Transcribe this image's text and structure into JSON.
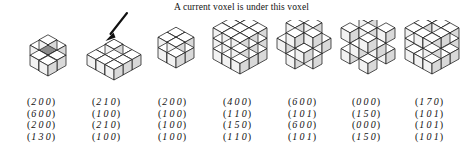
{
  "caption": {
    "text": "A current voxel is under this voxel"
  },
  "annotation": {
    "arrow_icon": "down-left-arrow-icon",
    "points_to_figure": 2
  },
  "colors": {
    "stroke": "#1a1a1a",
    "face_top": "#ffffff",
    "face_left": "#f2f2f2",
    "face_right": "#d9d9d9",
    "highlight_top": "#8c8c8c",
    "highlight_left": "#6e6e6e",
    "highlight_right": "#595959",
    "background": "#ffffff",
    "text": "#111111"
  },
  "figures": [
    {
      "id": "figure-1",
      "name": "plus-cross-voxel-figure",
      "x": 14,
      "highlighted": true,
      "cells": [
        [
          1,
          1,
          1,
          0,
          0,
          0
        ],
        [
          1,
          1,
          1,
          1,
          0,
          0
        ],
        [
          1,
          1,
          0,
          0,
          0,
          0
        ],
        [
          0,
          1,
          1,
          0,
          0,
          0
        ],
        [
          1,
          0,
          1,
          0,
          0,
          0
        ],
        [
          1,
          1,
          2,
          1,
          0,
          0
        ],
        [
          2,
          1,
          1,
          0,
          0,
          0
        ]
      ]
    },
    {
      "id": "figure-2",
      "name": "flat-layer-with-top-voxel-figure",
      "x": 84,
      "highlighted": false
    },
    {
      "id": "figure-3",
      "name": "two-by-two-cube-figure",
      "x": 152,
      "highlighted": true
    },
    {
      "id": "figure-4",
      "name": "three-by-three-solid-cube-figure",
      "x": 210,
      "highlighted": false
    },
    {
      "id": "figure-5",
      "name": "checker-voxel-cube-figure",
      "x": 272,
      "highlighted": false
    },
    {
      "id": "figure-6",
      "name": "alternating-voxel-cube-figure",
      "x": 336,
      "highlighted": false
    },
    {
      "id": "figure-7",
      "name": "cross-lattice-voxel-cube-figure",
      "x": 400,
      "highlighted": false
    }
  ],
  "matrices": [
    {
      "id": "matrix-1",
      "x": 8,
      "rows": [
        "200",
        "600",
        "200",
        "130"
      ]
    },
    {
      "id": "matrix-2",
      "x": 73,
      "rows": [
        "210",
        "100",
        "210",
        "100"
      ]
    },
    {
      "id": "matrix-3",
      "x": 139,
      "rows": [
        "200",
        "100",
        "100",
        "100"
      ]
    },
    {
      "id": "matrix-4",
      "x": 204,
      "rows": [
        "400",
        "110",
        "150",
        "110"
      ]
    },
    {
      "id": "matrix-5",
      "x": 269,
      "rows": [
        "600",
        "101",
        "600",
        "101"
      ]
    },
    {
      "id": "matrix-6",
      "x": 333,
      "rows": [
        "000",
        "150",
        "000",
        "150"
      ]
    },
    {
      "id": "matrix-7",
      "x": 396,
      "rows": [
        "170",
        "101",
        "101",
        "101"
      ]
    }
  ]
}
